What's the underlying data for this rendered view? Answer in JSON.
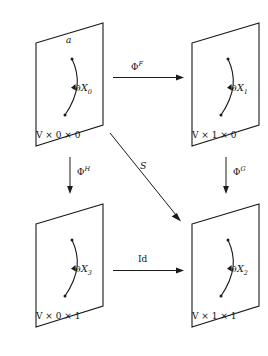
{
  "diagram": {
    "type": "commutative-diagram",
    "background_color": "#ffffff",
    "stroke_color": "#1a1a1a",
    "panels": [
      {
        "id": "top-left",
        "boundary_label": "∂X",
        "boundary_subscript": "0",
        "coordinate_label": "V × 0 × 0",
        "point_label": "a"
      },
      {
        "id": "top-right",
        "boundary_label": "∂X",
        "boundary_subscript": "1",
        "coordinate_label": "V × 1 × 0",
        "point_label": ""
      },
      {
        "id": "bottom-left",
        "boundary_label": "∂X",
        "boundary_subscript": "3",
        "coordinate_label": "V × 0 × 1",
        "point_label": ""
      },
      {
        "id": "bottom-right",
        "boundary_label": "∂X",
        "boundary_subscript": "2",
        "coordinate_label": "V × 1 × 1",
        "point_label": ""
      }
    ],
    "arrows": [
      {
        "id": "top-horizontal",
        "base": "Φ",
        "superscript": "F",
        "from": "top-left",
        "to": "top-right",
        "direction": "right"
      },
      {
        "id": "left-vertical",
        "base": "Φ",
        "superscript": "H",
        "from": "top-left",
        "to": "bottom-left",
        "direction": "down"
      },
      {
        "id": "right-vertical",
        "base": "Φ",
        "superscript": "G",
        "from": "top-right",
        "to": "bottom-right",
        "direction": "down"
      },
      {
        "id": "bottom-horizontal",
        "base": "Id",
        "superscript": "",
        "from": "bottom-left",
        "to": "bottom-right",
        "direction": "right"
      },
      {
        "id": "diagonal",
        "base": "S",
        "superscript": "",
        "from": "top-left",
        "to": "bottom-right",
        "direction": "down-right"
      }
    ]
  }
}
